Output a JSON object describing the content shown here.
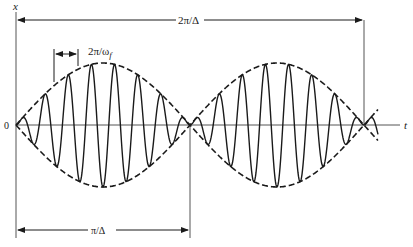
{
  "figure": {
    "type": "beat-phenomenon",
    "axis_labels": {
      "vertical": "x",
      "horizontal": "t",
      "origin": "0"
    },
    "annotations": {
      "beat_period": "2π/Δ",
      "half_beat_period": "π/Δ",
      "carrier_period": "2π/ω",
      "carrier_period_subscript": "f"
    },
    "signal": {
      "carrier_cycles_per_half_beat": 7.5,
      "half_beats_shown": 2,
      "envelope_style": "dashed",
      "colors": {
        "ink": "#1a1a1a",
        "axis": "#555555",
        "background": "#ffffff"
      }
    }
  }
}
